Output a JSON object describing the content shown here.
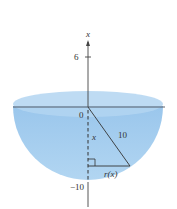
{
  "diagram": {
    "type": "hemisphere cross-section",
    "axis_label": "x",
    "ticks": [
      {
        "value": "6",
        "label": "6"
      },
      {
        "value": "0",
        "label": "0"
      },
      {
        "value": "-10",
        "label": "−10"
      }
    ],
    "radius_label": "10",
    "depth_label": "x",
    "radius_function_label": "r(x)",
    "colors": {
      "bowl_fill": "#9cc8ec",
      "bowl_rim": "#b8d8f2",
      "line": "#333333",
      "background": "#ffffff"
    }
  }
}
